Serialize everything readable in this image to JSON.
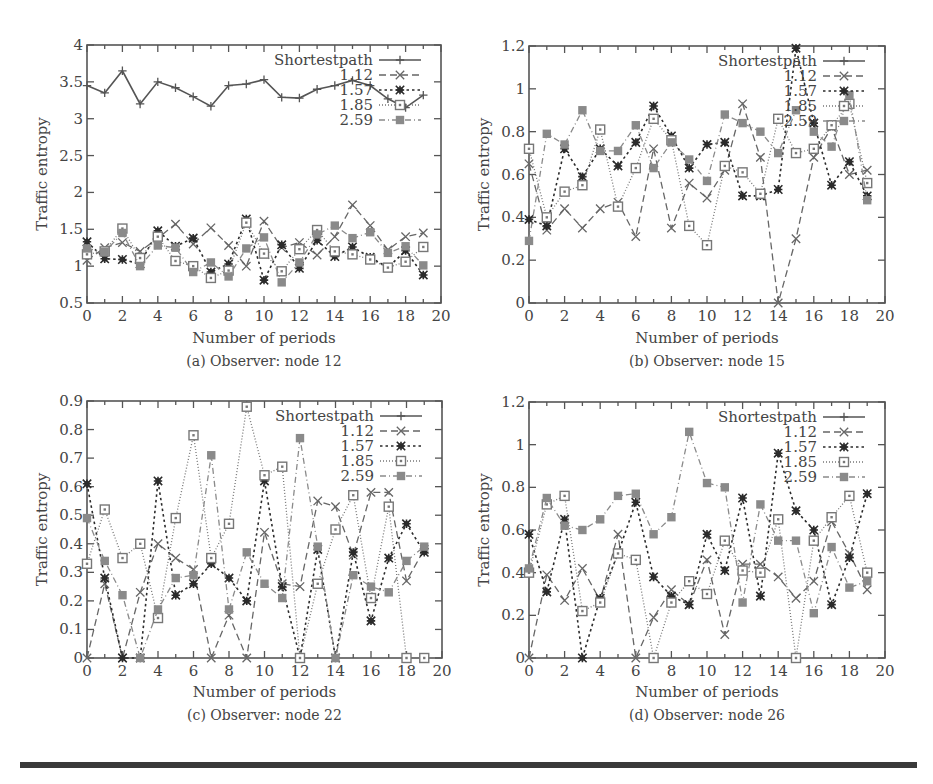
{
  "colors": {
    "shortestpath": "#555555",
    "s112": "#666666",
    "s157": "#2b2b2b",
    "s185": "#777777",
    "s259": "#8a8a8a",
    "separator": "#3a3a3a"
  },
  "chart_data": [
    {
      "type": "line",
      "id": "a",
      "caption": "(a) Observer: node 12",
      "xlabel": "Number of periods",
      "ylabel": "Traffic entropy",
      "xlim": [
        0,
        20
      ],
      "ylim": [
        0.5,
        4
      ],
      "xticks": [
        0,
        2,
        4,
        6,
        8,
        10,
        12,
        14,
        16,
        18,
        20
      ],
      "xtick_labels": [
        "0",
        "2",
        "4",
        "6",
        "8",
        "10",
        "12",
        "14",
        "16",
        "18",
        "20"
      ],
      "yticks": [
        0.5,
        1,
        1.5,
        2,
        2.5,
        3,
        3.5,
        4
      ],
      "ytick_labels": [
        "0.5",
        "1",
        "1.5",
        "2",
        "2.5",
        "3",
        "3.5",
        "4"
      ],
      "legend_position": "top-right",
      "x": [
        0,
        1,
        2,
        3,
        4,
        5,
        6,
        7,
        8,
        9,
        10,
        11,
        12,
        13,
        14,
        15,
        16,
        17,
        18,
        19
      ],
      "series": [
        {
          "name": "Shortestpath",
          "key": "shortestpath",
          "values": [
            3.45,
            3.35,
            3.65,
            3.2,
            3.5,
            3.42,
            3.3,
            3.17,
            3.45,
            3.47,
            3.53,
            3.29,
            3.28,
            3.4,
            3.45,
            3.52,
            3.45,
            3.27,
            3.15,
            3.32
          ]
        },
        {
          "name": "1.12",
          "key": "s112",
          "values": [
            1.08,
            1.25,
            1.32,
            1.2,
            1.38,
            1.57,
            1.3,
            1.52,
            1.28,
            1.0,
            1.61,
            1.25,
            1.32,
            1.15,
            1.4,
            1.83,
            1.55,
            1.22,
            1.4,
            1.45
          ]
        },
        {
          "name": "1.57",
          "key": "s157",
          "values": [
            1.33,
            1.1,
            1.09,
            1.03,
            1.48,
            1.27,
            1.38,
            0.92,
            1.03,
            1.64,
            0.81,
            1.29,
            0.97,
            1.35,
            1.13,
            1.26,
            1.12,
            0.98,
            1.21,
            0.88
          ]
        },
        {
          "name": "1.85",
          "key": "s185",
          "values": [
            1.16,
            1.2,
            1.51,
            1.11,
            1.4,
            1.07,
            1.0,
            0.84,
            0.94,
            1.59,
            1.17,
            0.93,
            1.23,
            1.49,
            1.2,
            1.16,
            1.09,
            0.98,
            1.06,
            1.26
          ]
        },
        {
          "name": "2.59",
          "key": "s259",
          "values": [
            1.24,
            1.19,
            1.45,
            1.0,
            1.28,
            1.25,
            0.92,
            1.05,
            0.86,
            1.24,
            1.39,
            0.78,
            1.05,
            1.43,
            1.55,
            1.38,
            1.46,
            1.18,
            1.27,
            1.01
          ]
        }
      ]
    },
    {
      "type": "line",
      "id": "b",
      "caption": "(b) Observer: node 15",
      "xlabel": "Number of periods",
      "ylabel": "Traffic entropy",
      "xlim": [
        0,
        20
      ],
      "ylim": [
        0,
        1.2
      ],
      "xticks": [
        0,
        2,
        4,
        6,
        8,
        10,
        12,
        14,
        16,
        18,
        20
      ],
      "xtick_labels": [
        "0",
        "2",
        "4",
        "6",
        "8",
        "10",
        "12",
        "14",
        "16",
        "18",
        "20"
      ],
      "yticks": [
        0,
        0.2,
        0.4,
        0.6,
        0.8,
        1,
        1.2
      ],
      "ytick_labels": [
        "0",
        "0.2",
        "0.4",
        "0.6",
        "0.8",
        "1",
        "1.2"
      ],
      "legend_position": "top-right",
      "x": [
        0,
        1,
        2,
        3,
        4,
        5,
        6,
        7,
        8,
        9,
        10,
        11,
        12,
        13,
        14,
        15,
        16,
        17,
        18,
        19
      ],
      "series": [
        {
          "name": "Shortestpath",
          "key": "shortestpath",
          "values": []
        },
        {
          "name": "1.12",
          "key": "s112",
          "values": [
            0.65,
            0.34,
            0.44,
            0.35,
            0.44,
            0.47,
            0.31,
            0.72,
            0.35,
            0.56,
            0.49,
            0.62,
            0.93,
            0.68,
            0.0,
            0.3,
            0.68,
            0.82,
            0.6,
            0.62
          ]
        },
        {
          "name": "1.57",
          "key": "s157",
          "values": [
            0.39,
            0.36,
            0.72,
            0.59,
            0.72,
            0.64,
            0.75,
            0.92,
            0.78,
            0.63,
            0.74,
            0.75,
            0.5,
            0.5,
            0.53,
            1.19,
            0.84,
            0.55,
            0.66,
            0.5
          ]
        },
        {
          "name": "1.85",
          "key": "s185",
          "values": [
            0.72,
            0.4,
            0.52,
            0.55,
            0.81,
            0.45,
            0.63,
            0.86,
            0.76,
            0.36,
            0.27,
            0.64,
            0.61,
            0.51,
            0.86,
            0.7,
            0.72,
            0.83,
            0.93,
            0.56
          ]
        },
        {
          "name": "2.59",
          "key": "s259",
          "values": [
            0.29,
            0.79,
            0.74,
            0.9,
            0.71,
            0.71,
            0.83,
            0.63,
            0.75,
            0.67,
            0.57,
            0.88,
            0.84,
            0.8,
            0.7,
            0.9,
            0.8,
            0.73,
            0.97,
            0.48
          ]
        }
      ]
    },
    {
      "type": "line",
      "id": "c",
      "caption": "(c) Observer: node 22",
      "xlabel": "Number of periods",
      "ylabel": "Traffic entropy",
      "xlim": [
        0,
        20
      ],
      "ylim": [
        0,
        0.9
      ],
      "xticks": [
        0,
        2,
        4,
        6,
        8,
        10,
        12,
        14,
        16,
        18,
        20
      ],
      "xtick_labels": [
        "0",
        "2",
        "4",
        "6",
        "8",
        "10",
        "12",
        "14",
        "16",
        "18",
        "20"
      ],
      "yticks": [
        0,
        0.1,
        0.2,
        0.3,
        0.4,
        0.5,
        0.6,
        0.7,
        0.8,
        0.9
      ],
      "ytick_labels": [
        "0",
        "0.1",
        "0.2",
        "0.3",
        "0.4",
        "0.5",
        "0.6",
        "0.7",
        "0.8",
        "0.9"
      ],
      "legend_position": "top-right",
      "x": [
        0,
        1,
        2,
        3,
        4,
        5,
        6,
        7,
        8,
        9,
        10,
        11,
        12,
        13,
        14,
        15,
        16,
        17,
        18,
        19
      ],
      "series": [
        {
          "name": "Shortestpath",
          "key": "shortestpath",
          "values": []
        },
        {
          "name": "1.12",
          "key": "s112",
          "values": [
            0.0,
            0.26,
            0.0,
            0.23,
            0.4,
            0.35,
            0.31,
            0.0,
            0.15,
            0.0,
            0.44,
            0.26,
            0.25,
            0.55,
            0.53,
            0.36,
            0.58,
            0.58,
            0.27,
            0.38
          ]
        },
        {
          "name": "1.57",
          "key": "s157",
          "values": [
            0.61,
            0.28,
            0.0,
            0.0,
            0.62,
            0.22,
            0.26,
            0.33,
            0.28,
            0.2,
            0.62,
            0.25,
            0.0,
            0.38,
            0.0,
            0.37,
            0.13,
            0.35,
            0.47,
            0.37
          ]
        },
        {
          "name": "1.85",
          "key": "s185",
          "values": [
            0.33,
            0.52,
            0.35,
            0.4,
            0.14,
            0.49,
            0.78,
            0.35,
            0.47,
            0.88,
            0.64,
            0.67,
            0.0,
            0.26,
            0.45,
            0.57,
            0.21,
            0.53,
            0.0,
            0.0
          ]
        },
        {
          "name": "2.59",
          "key": "s259",
          "values": [
            0.49,
            0.34,
            0.22,
            0.0,
            0.17,
            0.28,
            0.29,
            0.71,
            0.17,
            0.37,
            0.26,
            0.21,
            0.77,
            0.39,
            0.0,
            0.29,
            0.25,
            0.23,
            0.34,
            0.39
          ]
        }
      ]
    },
    {
      "type": "line",
      "id": "d",
      "caption": "(d) Observer: node 26",
      "xlabel": "Number of periods",
      "ylabel": "Traffic entropy",
      "xlim": [
        0,
        20
      ],
      "ylim": [
        0,
        1.2
      ],
      "xticks": [
        0,
        2,
        4,
        6,
        8,
        10,
        12,
        14,
        16,
        18,
        20
      ],
      "xtick_labels": [
        "0",
        "2",
        "4",
        "6",
        "8",
        "10",
        "12",
        "14",
        "16",
        "18",
        "20"
      ],
      "yticks": [
        0,
        0.2,
        0.4,
        0.6,
        0.8,
        1,
        1.2
      ],
      "ytick_labels": [
        "0",
        "0.2",
        "0.4",
        "0.6",
        "0.8",
        "1",
        "1.2"
      ],
      "legend_position": "top-right",
      "x": [
        0,
        1,
        2,
        3,
        4,
        5,
        6,
        7,
        8,
        9,
        10,
        11,
        12,
        13,
        14,
        15,
        16,
        17,
        18,
        19
      ],
      "series": [
        {
          "name": "Shortestpath",
          "key": "shortestpath",
          "values": []
        },
        {
          "name": "1.12",
          "key": "s112",
          "values": [
            0.0,
            0.39,
            0.27,
            0.42,
            0.27,
            0.58,
            0.0,
            0.19,
            0.32,
            0.25,
            0.46,
            0.11,
            0.44,
            0.44,
            0.38,
            0.28,
            0.36,
            0.64,
            0.49,
            0.32
          ]
        },
        {
          "name": "1.57",
          "key": "s157",
          "values": [
            0.58,
            0.31,
            0.65,
            0.0,
            0.28,
            0.49,
            0.73,
            0.38,
            0.29,
            0.25,
            0.58,
            0.41,
            0.75,
            0.29,
            0.96,
            0.69,
            0.6,
            0.25,
            0.47,
            0.77
          ]
        },
        {
          "name": "1.85",
          "key": "s185",
          "values": [
            0.4,
            0.72,
            0.76,
            0.22,
            0.26,
            0.49,
            0.46,
            0.0,
            0.26,
            0.36,
            0.3,
            0.55,
            0.41,
            0.4,
            0.65,
            0.0,
            0.55,
            0.66,
            0.76,
            0.4
          ]
        },
        {
          "name": "2.59",
          "key": "s259",
          "values": [
            0.42,
            0.75,
            0.62,
            0.6,
            0.65,
            0.76,
            0.77,
            0.58,
            0.66,
            1.06,
            0.82,
            0.8,
            0.26,
            0.72,
            0.55,
            0.55,
            0.21,
            0.52,
            0.33,
            0.36
          ]
        }
      ]
    }
  ]
}
